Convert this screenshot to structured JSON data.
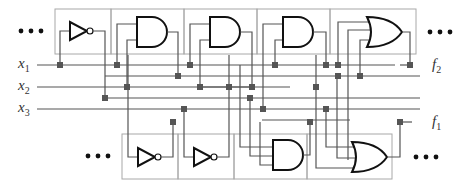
{
  "diagram": {
    "inputs": [
      {
        "name": "x",
        "sub": "1",
        "y": 65
      },
      {
        "name": "x",
        "sub": "2",
        "y": 87
      },
      {
        "name": "x",
        "sub": "3",
        "y": 109
      }
    ],
    "outputs": [
      {
        "name": "f",
        "sub": "2",
        "x": 410,
        "y": 65
      },
      {
        "name": "f",
        "sub": "1",
        "x": 410,
        "y": 122
      }
    ],
    "ellipsis": "• • •",
    "top_row_cells": [
      {
        "gate": "NOT",
        "x": 55,
        "w": 56
      },
      {
        "gate": "AND",
        "x": 111,
        "w": 73
      },
      {
        "gate": "AND",
        "x": 184,
        "w": 73
      },
      {
        "gate": "AND",
        "x": 257,
        "w": 73
      },
      {
        "gate": "OR",
        "x": 330,
        "w": 86
      }
    ],
    "bottom_row_cells": [
      {
        "gate": "NOT",
        "x": 122,
        "w": 56
      },
      {
        "gate": "NOT",
        "x": 178,
        "w": 56
      },
      {
        "gate": "AND",
        "x": 234,
        "w": 73
      },
      {
        "gate": "OR",
        "x": 307,
        "w": 85
      }
    ],
    "gate_labels": {
      "not": "NOT",
      "and": "AND",
      "or": "OR"
    },
    "colors": {
      "cell_border": "#a8a8a8",
      "wire": "#555555",
      "gate": "#111111",
      "switch": "#555555"
    }
  }
}
